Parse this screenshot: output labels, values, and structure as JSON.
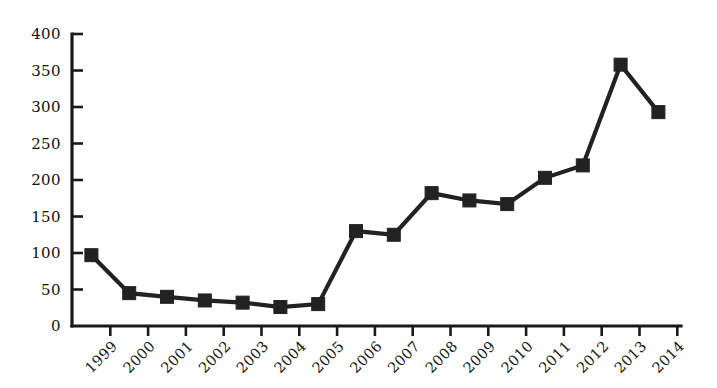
{
  "chart_data": {
    "type": "line",
    "title": "",
    "subtitle": "",
    "xlabel": "",
    "ylabel": "",
    "categories": [
      "1999",
      "2000",
      "2001",
      "2002",
      "2003",
      "2004",
      "2005",
      "2006",
      "2007",
      "2008",
      "2009",
      "2010",
      "2011",
      "2012",
      "2013",
      "2014"
    ],
    "values": [
      97,
      45,
      40,
      35,
      32,
      26,
      30,
      130,
      125,
      182,
      172,
      167,
      203,
      220,
      358,
      293
    ],
    "series": [
      {
        "name": "",
        "values": [
          97,
          45,
          40,
          35,
          32,
          26,
          30,
          130,
          125,
          182,
          172,
          167,
          203,
          220,
          358,
          293
        ]
      }
    ],
    "ylim": [
      0,
      400
    ],
    "yticks": [
      0,
      50,
      100,
      150,
      200,
      250,
      300,
      350,
      400
    ],
    "ytick_labels": [
      "0",
      "50",
      "100",
      "150",
      "200",
      "250",
      "300",
      "350",
      "400"
    ],
    "xtick_labels": [
      "1999",
      "2000",
      "2001",
      "2002",
      "2003",
      "2004",
      "2005",
      "2006",
      "2007",
      "2008",
      "2009",
      "2010",
      "2011",
      "2012",
      "2013",
      "2014"
    ],
    "xtick_rotation_deg": 45,
    "grid": false,
    "legend": false,
    "legend_position": "none",
    "marker": "square",
    "marker_color": "#222222",
    "line_color": "#222222",
    "axis_color": "#1a1a1a",
    "background": "#ffffff",
    "annotations": []
  },
  "geometry": {
    "plot_left": 72,
    "plot_baseline_y": 326,
    "plot_top_y": 34,
    "first_tick_x": 110.3,
    "tick_spacing_x": 37.8,
    "marker_offset_x": -18.9,
    "marker_size": 13,
    "y_value_max": 400
  }
}
